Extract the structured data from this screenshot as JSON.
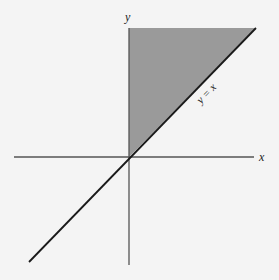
{
  "figure": {
    "labels": {
      "x_axis": "x",
      "y_axis": "y",
      "line": "y = x"
    },
    "colors": {
      "background": "#f4f4f4",
      "shaded_region": "#9a9a9a",
      "axes": "#555555",
      "line": "#1a1a1a",
      "text": "#222222"
    },
    "geometry": {
      "origin": [
        129,
        157
      ],
      "x_axis_range": [
        14,
        254
      ],
      "y_axis_range": [
        18,
        265
      ],
      "line_start": [
        29,
        262
      ],
      "line_end": [
        256,
        28
      ],
      "shaded_polygon": [
        [
          129,
          157
        ],
        [
          129,
          28
        ],
        [
          256,
          28
        ]
      ]
    }
  }
}
